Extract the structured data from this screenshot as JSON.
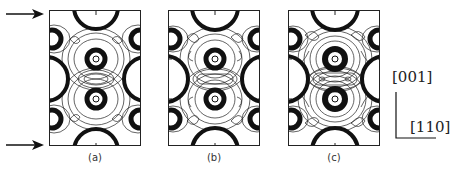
{
  "figure": {
    "type": "contour-map-series",
    "panels": [
      {
        "label": "(a)",
        "variant": "a"
      },
      {
        "label": "(b)",
        "variant": "b"
      },
      {
        "label": "(c)",
        "variant": "c"
      }
    ],
    "axes": {
      "vertical": "[001]",
      "horizontal": "[110]"
    },
    "markers": {
      "top_arrow": "arrow-right",
      "bottom_arrow": "arrow-right"
    }
  }
}
